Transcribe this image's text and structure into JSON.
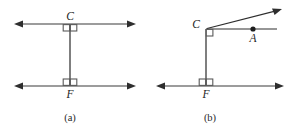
{
  "figure": {
    "type": "geometry-diagram",
    "background_color": "#ffffff",
    "line_color": "#3b3b3b",
    "label_color": "#1c1c1c",
    "panels": [
      {
        "id": "a",
        "caption": "(a)",
        "description": "Two parallel horizontal lines joined by a vertical transversal segment with right angle marks at C and F",
        "labels": {
          "top_vertex": "C",
          "bottom_vertex": "F"
        },
        "right_angle_marks": 2
      },
      {
        "id": "b",
        "caption": "(b)",
        "description": "A horizontal line with point F, a vertical segment rising to C, a horizontal ray from C through point A, and a slanted ray from C",
        "labels": {
          "top_vertex": "C",
          "ray_point": "A",
          "bottom_vertex": "F"
        },
        "right_angle_marks": 2
      }
    ]
  },
  "geometry": {
    "panel_a": {
      "top_line": {
        "x1": 14,
        "y1": 24,
        "x2": 136,
        "y2": 24
      },
      "bottom_line": {
        "x1": 14,
        "y1": 86,
        "x2": 136,
        "y2": 86
      },
      "transversal": {
        "x1": 70,
        "y1": 24,
        "x2": 70,
        "y2": 86
      },
      "label_C": {
        "x": 70,
        "y": 19
      },
      "label_F": {
        "x": 70,
        "y": 97
      },
      "caption": {
        "x": 70,
        "y": 120
      }
    },
    "panel_b": {
      "bottom_line": {
        "x1": 156,
        "y1": 86,
        "x2": 284,
        "y2": 86
      },
      "vertical_segment": {
        "x1": 206,
        "y1": 29,
        "x2": 206,
        "y2": 86
      },
      "horizontal_ray": {
        "x1": 206,
        "y1": 29,
        "x2": 277,
        "y2": 29
      },
      "slanted_ray": {
        "x1": 206,
        "y1": 29,
        "x2": 281,
        "y2": 9
      },
      "point_A": {
        "x": 253,
        "y": 29
      },
      "label_C": {
        "x": 196,
        "y": 27
      },
      "label_A": {
        "x": 253,
        "y": 41
      },
      "label_F": {
        "x": 206,
        "y": 97
      },
      "caption": {
        "x": 210,
        "y": 120
      }
    }
  }
}
